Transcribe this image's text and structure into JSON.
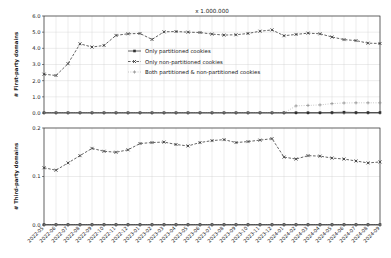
{
  "chart_data": {
    "type": "line",
    "title": "x 1.000.000",
    "xlabel": "",
    "categories": [
      "2022-05",
      "2022-06",
      "2022-07",
      "2022-08",
      "2022-09",
      "2022-10",
      "2022-11",
      "2022-12",
      "2023-01",
      "2023-02",
      "2023-03",
      "2023-04",
      "2023-05",
      "2023-06",
      "2023-07",
      "2023-08",
      "2023-09",
      "2023-10",
      "2023-11",
      "2023-12",
      "2024-01",
      "2024-02",
      "2024-03",
      "2024-04",
      "2024-05",
      "2024-06",
      "2024-07",
      "2024-08",
      "2024-09"
    ],
    "panels": [
      {
        "ylabel": "# First-party domains",
        "ylim": [
          0.0,
          6.0
        ],
        "yticks": [
          0.0,
          1.0,
          2.0,
          3.0,
          4.0,
          5.0,
          6.0
        ],
        "ytick_labels": [
          "0.0",
          "1.0",
          "2.0",
          "3.0",
          "4.0",
          "5.0",
          "6.0"
        ],
        "grid": true,
        "series": [
          {
            "name": "Only partitioned cookies",
            "style": "solid",
            "marker": "square",
            "values": [
              0.02,
              0.02,
              0.02,
              0.02,
              0.02,
              0.02,
              0.02,
              0.02,
              0.02,
              0.02,
              0.02,
              0.02,
              0.02,
              0.02,
              0.02,
              0.02,
              0.02,
              0.02,
              0.02,
              0.02,
              0.02,
              0.02,
              0.02,
              0.02,
              0.03,
              0.05,
              0.03,
              0.03,
              0.03
            ]
          },
          {
            "name": "Only non-partitioned cookies",
            "style": "dashed",
            "marker": "x",
            "values": [
              2.4,
              2.32,
              3.05,
              4.28,
              4.08,
              4.18,
              4.8,
              4.9,
              4.92,
              4.55,
              5.02,
              5.04,
              5.0,
              4.98,
              4.88,
              4.82,
              4.84,
              4.92,
              5.06,
              5.14,
              4.78,
              4.86,
              4.94,
              4.9,
              4.7,
              4.54,
              4.48,
              4.32,
              4.3
            ]
          },
          {
            "name": "Both partitioned & non-partitioned cookies",
            "style": "dotted",
            "marker": "plus",
            "values": [
              0.0,
              0.0,
              0.0,
              0.0,
              0.0,
              0.0,
              0.0,
              0.0,
              0.0,
              0.0,
              0.0,
              0.0,
              0.0,
              0.0,
              0.0,
              0.0,
              0.0,
              0.0,
              0.0,
              0.0,
              0.0,
              0.44,
              0.47,
              0.5,
              0.58,
              0.62,
              0.63,
              0.63,
              0.63
            ]
          }
        ]
      },
      {
        "ylabel": "# Third-party domains",
        "ylim": [
          0.0,
          0.2
        ],
        "yticks": [
          0.0,
          0.1,
          0.2
        ],
        "ytick_labels": [
          "0.0",
          "0.1",
          "0.2"
        ],
        "grid": true,
        "series": [
          {
            "name": "Only partitioned cookies",
            "style": "solid",
            "marker": "square",
            "values": [
              0.001,
              0.001,
              0.001,
              0.001,
              0.001,
              0.001,
              0.001,
              0.001,
              0.001,
              0.001,
              0.001,
              0.001,
              0.001,
              0.001,
              0.001,
              0.001,
              0.001,
              0.001,
              0.001,
              0.001,
              0.001,
              0.001,
              0.001,
              0.001,
              0.001,
              0.001,
              0.001,
              0.001,
              0.001
            ]
          },
          {
            "name": "Only non-partitioned cookies",
            "style": "dashed",
            "marker": "x",
            "values": [
              0.118,
              0.113,
              0.128,
              0.143,
              0.158,
              0.152,
              0.15,
              0.155,
              0.168,
              0.17,
              0.171,
              0.166,
              0.163,
              0.17,
              0.174,
              0.176,
              0.17,
              0.172,
              0.175,
              0.178,
              0.14,
              0.136,
              0.143,
              0.142,
              0.138,
              0.136,
              0.132,
              0.128,
              0.13
            ]
          },
          {
            "name": "Both partitioned & non-partitioned cookies",
            "style": "dotted",
            "marker": "plus",
            "values": [
              0.0,
              0.0,
              0.0,
              0.0,
              0.0,
              0.0,
              0.0,
              0.0,
              0.0,
              0.0,
              0.0,
              0.0,
              0.0,
              0.0,
              0.0,
              0.0,
              0.0,
              0.0,
              0.0,
              0.0,
              0.0,
              0.0,
              0.0,
              0.0,
              0.0,
              0.0,
              0.0,
              0.0,
              0.0
            ]
          }
        ]
      }
    ],
    "legend": {
      "position": "upper-center-inside-top-panel",
      "entries": [
        {
          "label": "Only partitioned cookies",
          "style": "solid",
          "marker": "square"
        },
        {
          "label": "Only non-partitioned cookies",
          "style": "dashed",
          "marker": "x"
        },
        {
          "label": "Both partitioned & non-partitioned cookies",
          "style": "dotted",
          "marker": "plus"
        }
      ]
    },
    "colors": {
      "line": "#303030",
      "grid": "#d0d0d0",
      "axis": "#303030",
      "background": "#ffffff"
    }
  }
}
